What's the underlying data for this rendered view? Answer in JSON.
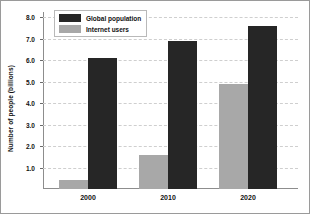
{
  "chart_data": {
    "type": "bar",
    "title": "",
    "xlabel": "",
    "ylabel": "Number of people (billions)",
    "categories": [
      "2000",
      "2010",
      "2020"
    ],
    "series": [
      {
        "name": "Global population",
        "color": "#262626",
        "values": [
          6.1,
          6.9,
          7.6
        ]
      },
      {
        "name": "Internet users",
        "color": "#a8a8a8",
        "values": [
          0.4,
          1.6,
          4.9
        ]
      }
    ],
    "ylim": [
      0,
      8
    ],
    "yticks": [
      "1.0",
      "2.0",
      "3.0",
      "4.0",
      "5.0",
      "6.0",
      "7.0",
      "8.0"
    ],
    "ytick_values": [
      1,
      2,
      3,
      4,
      5,
      6,
      7,
      8
    ],
    "grid": true,
    "legend_position": "top-left"
  },
  "legend": {
    "entries": [
      {
        "label": "Global population"
      },
      {
        "label": "Internet users"
      }
    ]
  }
}
